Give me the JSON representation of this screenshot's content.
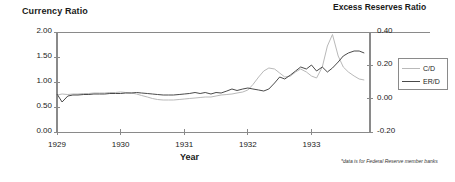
{
  "chart_data": {
    "type": "line",
    "title": "",
    "ylabel": "Currency Ratio",
    "y2label": "Excess Reserves Ratio",
    "xlabel": "Year",
    "footnote": "*data is for Federal Reserve member banks",
    "grid": false,
    "legend_position": "right",
    "xlim": [
      1929.0,
      1933.92
    ],
    "ylim": [
      0.0,
      2.0
    ],
    "y2lim": [
      -0.2,
      0.4
    ],
    "yticks": [
      "0.00",
      "0.50",
      "1.00",
      "1.50",
      "2.00"
    ],
    "ytick_values": [
      0.0,
      0.5,
      1.0,
      1.5,
      2.0
    ],
    "y2ticks": [
      "-0.20",
      "0.00",
      "0.20",
      "0.40"
    ],
    "y2tick_values": [
      -0.2,
      0.0,
      0.2,
      0.4
    ],
    "xticks": [
      "1929",
      "1930",
      "1931",
      "1932",
      "1933"
    ],
    "xtick_values": [
      1929,
      1930,
      1931,
      1932,
      1933
    ],
    "series": [
      {
        "name": "C/D",
        "axis": "right",
        "color": "#b9b9b9",
        "x": [
          1929.0,
          1929.08,
          1929.17,
          1929.25,
          1929.33,
          1929.42,
          1929.5,
          1929.58,
          1929.67,
          1929.75,
          1929.83,
          1929.92,
          1930.0,
          1930.08,
          1930.17,
          1930.25,
          1930.33,
          1930.42,
          1930.5,
          1930.58,
          1930.67,
          1930.75,
          1930.83,
          1930.92,
          1931.0,
          1931.08,
          1931.17,
          1931.25,
          1931.33,
          1931.42,
          1931.5,
          1931.58,
          1931.67,
          1931.75,
          1931.83,
          1931.92,
          1932.0,
          1932.08,
          1932.17,
          1932.25,
          1932.33,
          1932.42,
          1932.5,
          1932.58,
          1932.67,
          1932.75,
          1932.83,
          1932.92,
          1933.0,
          1933.08,
          1933.17,
          1933.25,
          1933.33,
          1933.42,
          1933.5,
          1933.58,
          1933.67,
          1933.75,
          1933.83
        ],
        "values": [
          0.74,
          0.76,
          0.75,
          0.76,
          0.76,
          0.77,
          0.77,
          0.78,
          0.78,
          0.78,
          0.79,
          0.79,
          0.8,
          0.79,
          0.78,
          0.76,
          0.73,
          0.7,
          0.67,
          0.65,
          0.64,
          0.64,
          0.64,
          0.65,
          0.66,
          0.67,
          0.68,
          0.69,
          0.7,
          0.7,
          0.72,
          0.74,
          0.75,
          0.76,
          0.78,
          0.8,
          0.84,
          0.95,
          1.1,
          1.22,
          1.28,
          1.26,
          1.18,
          1.1,
          1.12,
          1.2,
          1.26,
          1.2,
          1.12,
          1.08,
          1.3,
          1.72,
          1.95,
          1.52,
          1.3,
          1.2,
          1.12,
          1.06,
          1.04
        ]
      },
      {
        "name": "ER/D",
        "axis": "right",
        "color": "#4a4a4a",
        "x": [
          1929.0,
          1929.08,
          1929.17,
          1929.25,
          1929.33,
          1929.42,
          1929.5,
          1929.58,
          1929.67,
          1929.75,
          1929.83,
          1929.92,
          1930.0,
          1930.08,
          1930.17,
          1930.25,
          1930.33,
          1930.42,
          1930.5,
          1930.58,
          1930.67,
          1930.75,
          1930.83,
          1930.92,
          1931.0,
          1931.08,
          1931.17,
          1931.25,
          1931.33,
          1931.42,
          1931.5,
          1931.58,
          1931.67,
          1931.75,
          1931.83,
          1931.92,
          1932.0,
          1932.08,
          1932.17,
          1932.25,
          1932.33,
          1932.42,
          1932.5,
          1932.58,
          1932.67,
          1932.75,
          1932.83,
          1932.92,
          1933.0,
          1933.08,
          1933.17,
          1933.25,
          1933.33,
          1933.42,
          1933.5,
          1933.58,
          1933.67,
          1933.75,
          1933.83
        ],
        "values": [
          0.76,
          0.6,
          0.72,
          0.74,
          0.74,
          0.75,
          0.75,
          0.76,
          0.76,
          0.76,
          0.77,
          0.77,
          0.77,
          0.78,
          0.78,
          0.79,
          0.78,
          0.77,
          0.76,
          0.75,
          0.74,
          0.74,
          0.74,
          0.75,
          0.76,
          0.77,
          0.79,
          0.77,
          0.79,
          0.76,
          0.79,
          0.78,
          0.82,
          0.86,
          0.83,
          0.86,
          0.88,
          0.86,
          0.84,
          0.82,
          0.86,
          0.98,
          1.1,
          1.06,
          1.14,
          1.22,
          1.3,
          1.26,
          1.34,
          1.22,
          1.3,
          1.2,
          1.28,
          1.4,
          1.52,
          1.58,
          1.62,
          1.62,
          1.58
        ]
      }
    ]
  },
  "legend": {
    "items": [
      {
        "label": "C/D"
      },
      {
        "label": "ER/D"
      }
    ]
  },
  "axis_titles": {
    "left": "Currency Ratio",
    "right": "Excess Reserves Ratio",
    "bottom": "Year"
  },
  "colors": {
    "cd_line": "#b9b9b9",
    "erd_line": "#4a4a4a",
    "axis": "#8a8a8a",
    "text": "#1a1a1a"
  }
}
